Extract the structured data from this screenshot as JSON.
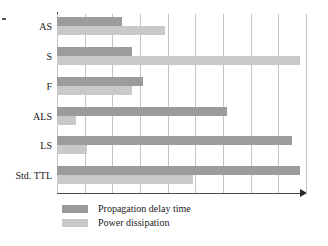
{
  "chart_data": {
    "type": "bar",
    "orientation": "horizontal",
    "title": "",
    "subtitle": "",
    "xlabel": "",
    "ylabel": "",
    "categories": [
      "AS",
      "S",
      "F",
      "ALS",
      "LS",
      "Std. TTL"
    ],
    "series": [
      {
        "name": "Propagation delay time",
        "color": "#9c9c9c",
        "values": [
          2.35,
          2.7,
          3.1,
          6.15,
          8.5,
          8.8
        ]
      },
      {
        "name": "Power dissipation",
        "color": "#c9c9c9",
        "values": [
          3.9,
          8.8,
          2.7,
          0.7,
          1.1,
          4.9
        ]
      }
    ],
    "xlim": [
      0,
      9
    ],
    "tick_labels": [],
    "gridline_count": 10,
    "grid": true,
    "legend_position": "bottom-left",
    "axis_arrow": true,
    "annotations": []
  },
  "legend": {
    "items": [
      {
        "label": "Propagation delay time",
        "color": "#9c9c9c"
      },
      {
        "label": "Power dissipation",
        "color": "#c9c9c9"
      }
    ]
  },
  "colors": {
    "delay_bar": "#9c9c9c",
    "power_bar": "#c9c9c9",
    "gridline": "#c4c4c4",
    "axis": "#4a4a4a",
    "text": "#1a1a1a",
    "background": "#ffffff"
  }
}
